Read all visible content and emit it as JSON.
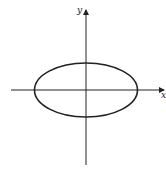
{
  "diagram": {
    "axes": {
      "x_label": "x",
      "y_label": "y",
      "origin": [
        86,
        90
      ],
      "x_range_px": [
        11,
        165
      ],
      "y_range_px": [
        10,
        165
      ]
    },
    "ellipse": {
      "cx": 86,
      "cy": 90,
      "rx": 51.5,
      "ry": 27,
      "stroke": "#222222",
      "stroke_width": 1.6
    },
    "colors": {
      "ink": "#222222",
      "background": "#ffffff"
    }
  }
}
